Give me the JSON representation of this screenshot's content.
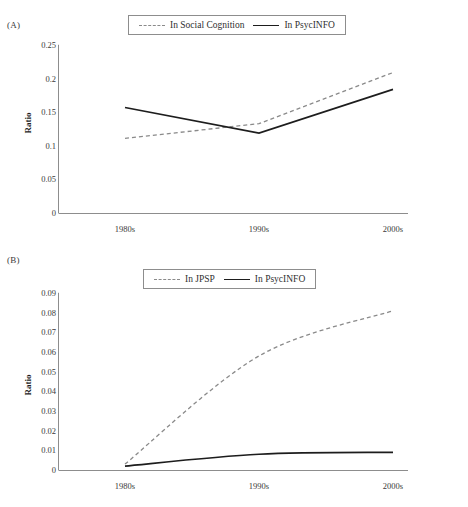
{
  "figure": {
    "panels": [
      {
        "id": "A",
        "label": "(A)",
        "legend": [
          {
            "name": "In Social Cognition",
            "style": "dashed"
          },
          {
            "name": "In PsycINFO",
            "style": "solid"
          }
        ]
      },
      {
        "id": "B",
        "label": "(B)",
        "legend": [
          {
            "name": "In JPSP",
            "style": "dashed"
          },
          {
            "name": "In PsycINFO",
            "style": "solid"
          }
        ]
      }
    ]
  },
  "chart_data": [
    {
      "type": "line",
      "panel": "A",
      "title": "",
      "xlabel": "",
      "ylabel": "Ratio",
      "categories": [
        "1980s",
        "1990s",
        "2000s"
      ],
      "ylim": [
        0,
        0.25
      ],
      "yticks": [
        0,
        0.05,
        0.1,
        0.15,
        0.2,
        0.25
      ],
      "ytick_labels": [
        "0",
        "0.05",
        "0.1",
        "0.15",
        "0.2",
        "0.25"
      ],
      "grid": false,
      "legend_position": "top-center",
      "series": [
        {
          "name": "In Social Cognition",
          "style": "dashed",
          "color": "#8a8a8a",
          "values": [
            0.111,
            0.133,
            0.209
          ]
        },
        {
          "name": "In PsycINFO",
          "style": "solid",
          "color": "#1d1d1d",
          "values": [
            0.157,
            0.119,
            0.184
          ]
        }
      ]
    },
    {
      "type": "line",
      "panel": "B",
      "title": "",
      "xlabel": "",
      "ylabel": "Ratio",
      "categories": [
        "1980s",
        "1990s",
        "2000s"
      ],
      "ylim": [
        0,
        0.09
      ],
      "yticks": [
        0,
        0.01,
        0.02,
        0.03,
        0.04,
        0.05,
        0.06,
        0.07,
        0.08,
        0.09
      ],
      "ytick_labels": [
        "0",
        "0.01",
        "0.02",
        "0.03",
        "0.04",
        "0.05",
        "0.06",
        "0.07",
        "0.08",
        "0.09"
      ],
      "grid": false,
      "legend_position": "top-center",
      "series": [
        {
          "name": "In JPSP",
          "style": "dashed",
          "color": "#8a8a8a",
          "values": [
            0.003,
            0.058,
            0.081
          ]
        },
        {
          "name": "In PsycINFO",
          "style": "solid",
          "color": "#1d1d1d",
          "values": [
            0.002,
            0.008,
            0.009
          ]
        }
      ]
    }
  ]
}
